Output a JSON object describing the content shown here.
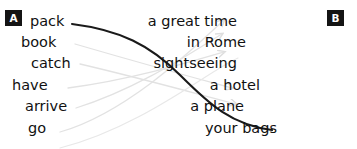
{
  "exercise": {
    "column_a": {
      "badge": "A",
      "items": [
        {
          "label": "pack",
          "x": 30,
          "y": 14
        },
        {
          "label": "book",
          "x": 21,
          "y": 35
        },
        {
          "label": "catch",
          "x": 31,
          "y": 56
        },
        {
          "label": "have",
          "x": 12,
          "y": 78
        },
        {
          "label": "arrive",
          "x": 25,
          "y": 99
        },
        {
          "label": "go",
          "x": 28,
          "y": 121
        }
      ]
    },
    "column_b": {
      "badge": "B",
      "items": [
        {
          "label": "a great time",
          "right": 120,
          "y": 14
        },
        {
          "label": "in Rome",
          "right": 111,
          "y": 35
        },
        {
          "label": "sightseeing",
          "right": 120,
          "y": 56
        },
        {
          "label": "a hotel",
          "right": 97,
          "y": 78
        },
        {
          "label": "a plane",
          "right": 113,
          "y": 99
        },
        {
          "label": "your bags",
          "right": 80,
          "y": 121
        }
      ]
    },
    "connections": {
      "answered": [
        {
          "from": "pack",
          "to": "your bags",
          "path": "M 72 24 C 120 30, 150 45, 180 75 C 210 105, 232 125, 272 130",
          "color": "#1a1a1a",
          "width": 2.1
        }
      ],
      "guides": [
        {
          "path": "M 75 44 C 130 60, 180 74, 232 88",
          "color": "#e2e2e2",
          "width": 1.3,
          "arrow": true
        },
        {
          "path": "M 80 64 C 140 78, 190 92, 236 104",
          "color": "#e2e2e2",
          "width": 1.3,
          "arrow": true
        },
        {
          "path": "M 68 88 C 130 80, 190 62, 224 52",
          "color": "#e2e2e2",
          "width": 1.3,
          "arrow": true
        },
        {
          "path": "M 76 108 C 140 88, 195 50, 222 34",
          "color": "#e2e2e2",
          "width": 1.3,
          "arrow": true
        },
        {
          "path": "M 60 132 C 130 112, 200 42, 224 20",
          "color": "#e2e2e2",
          "width": 1.3,
          "arrow": true
        },
        {
          "path": "M 60 148 C 140 128, 210 70, 238 58",
          "color": "#e8e8e8",
          "width": 1.2,
          "arrow": false
        }
      ]
    }
  }
}
